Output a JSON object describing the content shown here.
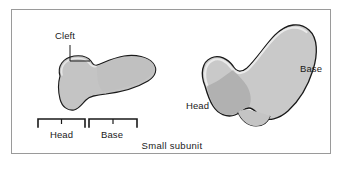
{
  "figure": {
    "caption": "Small subunit",
    "frame_color": "#9a9a9a",
    "background_color": "#ffffff"
  },
  "labels": {
    "cleft": "Cleft",
    "head_left": "Head",
    "base_left": "Base",
    "head_right": "Head",
    "base_right": "Base"
  },
  "shapes": {
    "left_profile": {
      "name": "small-subunit-side-view",
      "fill": "#c4c4c4",
      "shade": "#b0b0b0",
      "outline": "#1a1a1a"
    },
    "right_profile": {
      "name": "small-subunit-front-view",
      "fill": "#c9c9c9",
      "shade": "#b0b0b0",
      "outline": "#1a1a1a"
    }
  },
  "annotations": {
    "leader_color": "#1a1a1a",
    "bracket_color": "#1a1a1a"
  }
}
